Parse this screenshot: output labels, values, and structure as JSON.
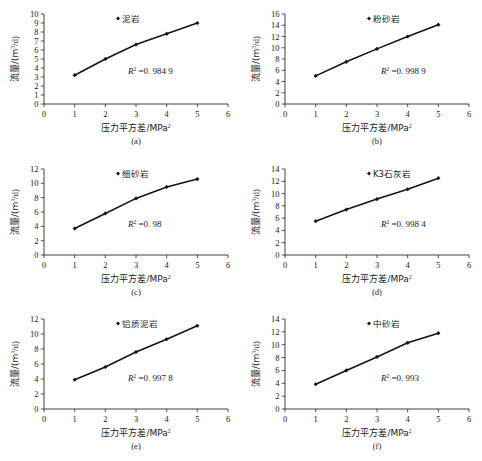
{
  "figure": {
    "x_axis_label": "压力平方差/MPa",
    "x_axis_label_sup": "2",
    "y_axis_label": "流量/(m",
    "y_axis_label_sup": "3",
    "y_axis_label_tail": "/d)",
    "r2_symbol": "R",
    "r2_sup": "2",
    "marker_icon": "diamond-marker-icon"
  },
  "chart_data": [
    {
      "type": "line",
      "panel": "a",
      "caption": "(a)",
      "title": "",
      "legend": "泥岩",
      "legend_position": "top-center",
      "annotation": "R² =0. 984 9",
      "r2_value": "=0. 984 9",
      "xlabel": "压力平方差/MPa²",
      "ylabel": "流量/(m³/d)",
      "x": [
        1,
        2,
        3,
        4,
        5
      ],
      "values": [
        3.2,
        5.0,
        6.6,
        7.8,
        9.0
      ],
      "xlim": [
        0,
        6
      ],
      "ylim": [
        0,
        10
      ],
      "xticks": [
        "0",
        "1",
        "2",
        "3",
        "4",
        "5",
        "6"
      ],
      "yticks": [
        "0",
        "1",
        "2",
        "3",
        "4",
        "5",
        "6",
        "7",
        "8",
        "9",
        "10"
      ],
      "grid": false
    },
    {
      "type": "line",
      "panel": "b",
      "caption": "(b)",
      "title": "",
      "legend": "粉砂岩",
      "legend_position": "top-center",
      "annotation": "R² =0. 998 9",
      "r2_value": "=0. 998 9",
      "xlabel": "压力平方差/MPa²",
      "ylabel": "流量/(m³/d)",
      "x": [
        1,
        2,
        3,
        4,
        5
      ],
      "values": [
        5.0,
        7.5,
        9.8,
        12.0,
        14.1
      ],
      "xlim": [
        0,
        6
      ],
      "ylim": [
        0,
        16
      ],
      "xticks": [
        "0",
        "1",
        "2",
        "3",
        "4",
        "5",
        "6"
      ],
      "yticks": [
        "0",
        "2",
        "4",
        "6",
        "8",
        "10",
        "12",
        "14",
        "16"
      ],
      "grid": false
    },
    {
      "type": "line",
      "panel": "c",
      "caption": "(c)",
      "title": "",
      "legend": "细砂岩",
      "legend_position": "top-center",
      "annotation": "R² =0. 98",
      "r2_value": "=0. 98",
      "xlabel": "压力平方差/MPa²",
      "ylabel": "流量/(m³/d)",
      "x": [
        1,
        2,
        3,
        4,
        5
      ],
      "values": [
        3.7,
        5.8,
        7.9,
        9.5,
        10.6
      ],
      "xlim": [
        0,
        6
      ],
      "ylim": [
        0,
        12
      ],
      "xticks": [
        "0",
        "1",
        "2",
        "3",
        "4",
        "5",
        "6"
      ],
      "yticks": [
        "0",
        "2",
        "4",
        "6",
        "8",
        "10",
        "12"
      ],
      "grid": false
    },
    {
      "type": "line",
      "panel": "d",
      "caption": "(d)",
      "title": "",
      "legend": "K3石灰岩",
      "legend_position": "top-center",
      "annotation": "R² =0. 998 4",
      "r2_value": "=0. 998 4",
      "xlabel": "压力平方差/MPa²",
      "ylabel": "流量/(m³/d)",
      "x": [
        1,
        2,
        3,
        4,
        5
      ],
      "values": [
        5.5,
        7.4,
        9.1,
        10.7,
        12.5
      ],
      "xlim": [
        0,
        6
      ],
      "ylim": [
        0,
        14
      ],
      "xticks": [
        "0",
        "1",
        "2",
        "3",
        "4",
        "5",
        "6"
      ],
      "yticks": [
        "0",
        "2",
        "4",
        "6",
        "8",
        "10",
        "12",
        "14"
      ],
      "grid": false
    },
    {
      "type": "line",
      "panel": "e",
      "caption": "(e)",
      "title": "",
      "legend": "铝质泥岩",
      "legend_position": "top-center",
      "annotation": "R² =0. 997 8",
      "r2_value": "=0. 997 8",
      "xlabel": "压力平方差/MPa²",
      "ylabel": "流量/(m³/d)",
      "x": [
        1,
        2,
        3,
        4,
        5
      ],
      "values": [
        3.9,
        5.6,
        7.6,
        9.3,
        11.1
      ],
      "xlim": [
        0,
        6
      ],
      "ylim": [
        0,
        12
      ],
      "xticks": [
        "0",
        "1",
        "2",
        "3",
        "4",
        "5",
        "6"
      ],
      "yticks": [
        "0",
        "2",
        "4",
        "6",
        "8",
        "10",
        "12"
      ],
      "grid": false
    },
    {
      "type": "line",
      "panel": "f",
      "caption": "(f)",
      "title": "",
      "legend": "中砂岩",
      "legend_position": "top-center",
      "annotation": "R² =0. 993",
      "r2_value": "=0. 993",
      "xlabel": "压力平方差/MPa²",
      "ylabel": "流量/(m³/d)",
      "x": [
        1,
        2,
        3,
        4,
        5
      ],
      "values": [
        3.85,
        6.0,
        8.1,
        10.3,
        11.8
      ],
      "xlim": [
        0,
        6
      ],
      "ylim": [
        0,
        14
      ],
      "xticks": [
        "0",
        "1",
        "2",
        "3",
        "4",
        "5",
        "6"
      ],
      "yticks": [
        "0",
        "2",
        "4",
        "6",
        "8",
        "10",
        "12",
        "14"
      ],
      "grid": false
    }
  ]
}
